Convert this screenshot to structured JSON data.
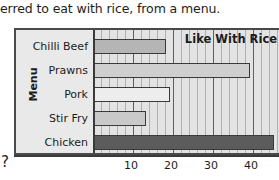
{
  "question": {
    "text": "erred to eat with rice, from a menu.",
    "trailing_marker": "?"
  },
  "chart_data": {
    "type": "bar",
    "orientation": "horizontal",
    "title": "",
    "legend_label": "Like With Rice",
    "legend_position": "top-right-inside",
    "ylabel": "Menu",
    "xlabel": "",
    "categories": [
      "Chilli Beef",
      "Prawns",
      "Pork",
      "Stir Fry",
      "Chicken"
    ],
    "values": [
      18,
      39,
      19,
      13,
      45
    ],
    "xlim": [
      0,
      46
    ],
    "xticks": [
      10,
      20,
      30,
      40
    ],
    "xtick_labels": [
      "10",
      "20",
      "30",
      "40"
    ],
    "minor_tick_step": 2,
    "grid": true,
    "bars": [
      {
        "category": "Chilli Beef",
        "value": 18,
        "color": "#b5b5b5"
      },
      {
        "category": "Prawns",
        "value": 39,
        "color": "#cfcfcf"
      },
      {
        "category": "Pork",
        "value": 19,
        "color": "#ededed"
      },
      {
        "category": "Stir Fry",
        "value": 13,
        "color": "#c9c9c9"
      },
      {
        "category": "Chicken",
        "value": 45,
        "color": "#5c5c5c"
      }
    ]
  },
  "colors": {
    "plot_background": "#e3e3e3",
    "panel_background": "#e9e9e9",
    "axis": "#3a3a3a",
    "gridline_minor": "#b0b0b0",
    "gridline_major": "#606060",
    "text": "#1c1c1c"
  }
}
